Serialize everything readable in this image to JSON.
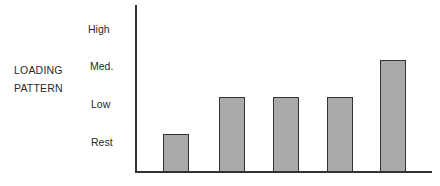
{
  "chart_data": {
    "type": "bar",
    "title": "",
    "xlabel": "",
    "ylabel": "LOADING PATTERN",
    "ylabel_lines": [
      "LOADING",
      "PATTERN"
    ],
    "y_ticks": [
      "Rest",
      "Low",
      "Med.",
      "High"
    ],
    "categories": [
      "1",
      "2",
      "3",
      "4",
      "5"
    ],
    "values": [
      0.5,
      1.5,
      1.5,
      1.5,
      2.5
    ],
    "value_labels": [
      "Rest",
      "Low",
      "Low",
      "Low",
      "Med."
    ],
    "ylim": [
      0,
      3.5
    ],
    "grid": false,
    "legend": null,
    "colors": {
      "bar_fill": "#a9a9a9",
      "bar_edge": "#333333",
      "axis": "#333333"
    }
  }
}
